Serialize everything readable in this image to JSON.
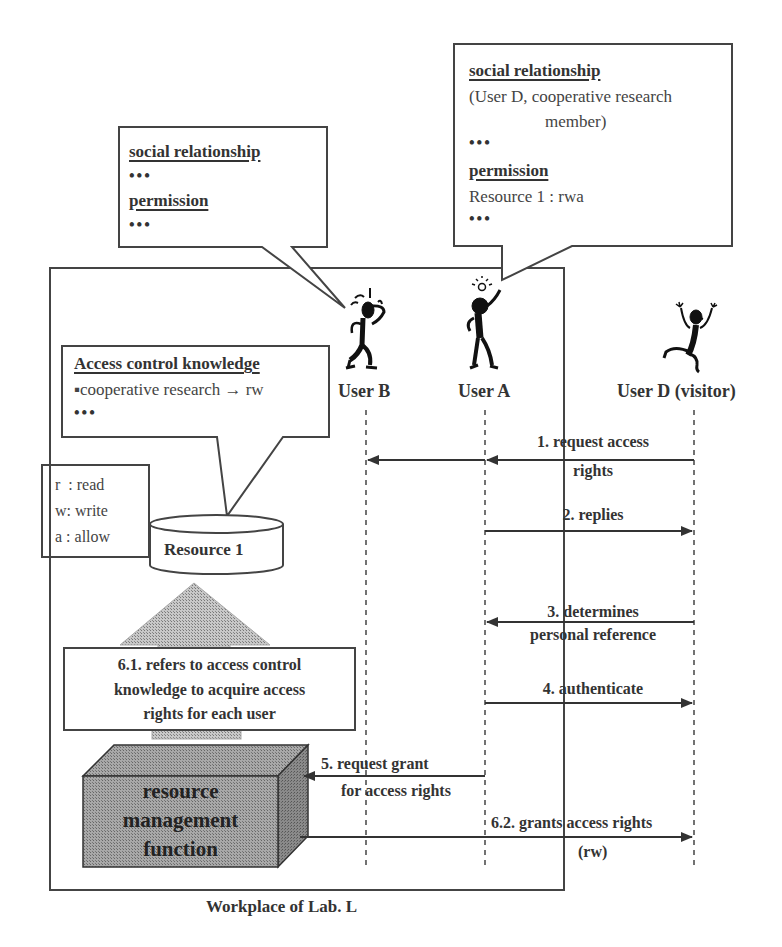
{
  "diagram": {
    "title": "Workplace of Lab. L",
    "bubble_user_b": {
      "heading1": "social relationship",
      "line1": "•••",
      "heading2": "permission",
      "line2": "•••"
    },
    "bubble_user_a": {
      "heading1": "social relationship",
      "line1a": "(User D, cooperative research",
      "line1b": "member)",
      "dots1": "•••",
      "heading2": "permission",
      "line2": "Resource 1 : rwa",
      "dots2": "•••"
    },
    "access_control": {
      "heading": "Access control knowledge",
      "rule": "▪cooperative research → rw",
      "dots": "•••"
    },
    "legend": {
      "r": "r  : read",
      "w": "w: write",
      "a": "a : allow"
    },
    "resource": "Resource 1",
    "step_6_1": {
      "line1": "6.1. refers to access control",
      "line2": "knowledge to acquire access",
      "line3": "rights for each user"
    },
    "rmf": {
      "line1": "resource",
      "line2": "management",
      "line3": "function"
    },
    "actors": [
      {
        "name": "User B",
        "icon": "stick-figure-thinking"
      },
      {
        "name": "User A",
        "icon": "stick-figure-idea"
      },
      {
        "name": "User D (visitor)",
        "icon": "stick-figure-cheering"
      }
    ],
    "messages": [
      {
        "id": "1",
        "line1": "1. request access",
        "line2": "rights",
        "from": "User D (visitor)",
        "to": [
          "User A",
          "User B"
        ]
      },
      {
        "id": "2",
        "line1": "2. replies",
        "from": "User A",
        "to": "User D (visitor)"
      },
      {
        "id": "3",
        "line1": "3. determines",
        "line2": "personal reference",
        "from": "User D (visitor)",
        "to": "User A"
      },
      {
        "id": "4",
        "line1": "4. authenticate",
        "from": "User A",
        "to": "User D (visitor)"
      },
      {
        "id": "5",
        "line1": "5. request grant",
        "line2": "for access rights",
        "from": "User A",
        "to": "resource management function"
      },
      {
        "id": "6.2",
        "line1": "6.2. grants access rights",
        "line2": "(rw)",
        "from": "resource management function",
        "to": "User D (visitor)"
      }
    ]
  }
}
